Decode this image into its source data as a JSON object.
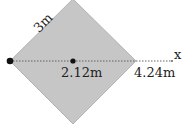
{
  "diagram": {
    "shape": "square rotated 45 degrees (diamond)",
    "fill_color": "#c6c6c6",
    "edge_color": "#999999",
    "side_label": "3m",
    "axis_label": "x",
    "points": [
      {
        "name": "left-vertex",
        "label": ""
      },
      {
        "name": "center-point",
        "label": "2.12m"
      },
      {
        "name": "right-vertex",
        "label": "4.24m"
      }
    ]
  }
}
